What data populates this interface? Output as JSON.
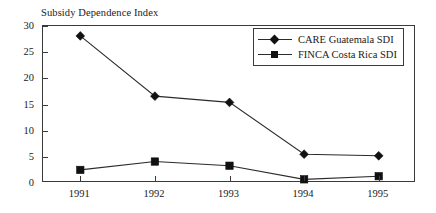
{
  "chart_data": {
    "type": "line",
    "title": "Subsidy Dependence Index",
    "xlabel": "",
    "ylabel": "",
    "categories": [
      "1991",
      "1992",
      "1993",
      "1994",
      "1995"
    ],
    "ylim": [
      0,
      30
    ],
    "yticks": [
      0,
      5,
      10,
      15,
      20,
      25,
      30
    ],
    "ytick_labels": [
      "0",
      "5",
      "10",
      "15",
      "20",
      "25",
      "30"
    ],
    "grid": false,
    "legend_position": "top-right",
    "series": [
      {
        "name": "CARE Guatemala SDI",
        "marker": "diamond",
        "color": "#111111",
        "values": [
          28.1,
          16.6,
          15.4,
          5.5,
          5.2
        ]
      },
      {
        "name": "FINCA Costa Rica SDI",
        "marker": "square",
        "color": "#111111",
        "values": [
          2.5,
          4.1,
          3.3,
          0.7,
          1.3
        ]
      }
    ]
  },
  "legend": {
    "entries": [
      {
        "label": "CARE Guatemala SDI"
      },
      {
        "label": "FINCA Costa Rica SDI"
      }
    ]
  },
  "colors": {
    "background": "#ffffff",
    "axis": "#3a3a3a",
    "line": "#2b2b2b",
    "marker": "#111111",
    "text": "#1a1a1a"
  }
}
